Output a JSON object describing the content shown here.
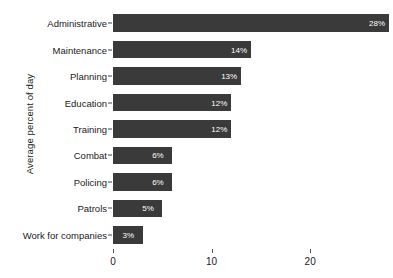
{
  "chart_data": {
    "type": "bar",
    "orientation": "horizontal",
    "title": "",
    "xlabel": "",
    "ylabel": "Average percent of day",
    "xlim": [
      0,
      28.2
    ],
    "ylim": null,
    "grid": false,
    "legend": null,
    "bar_color": "#3a3a3a",
    "value_label_color": "#ffffff",
    "background_color": "#ffffff",
    "xticks": [
      0,
      10,
      20
    ],
    "xtick_labels": [
      "0",
      "10",
      "20"
    ],
    "categories": [
      "Administrative",
      "Maintenance",
      "Planning",
      "Education",
      "Training",
      "Combat",
      "Policing",
      "Patrols",
      "Work for companies"
    ],
    "values": [
      28,
      14,
      13,
      12,
      12,
      6,
      6,
      5,
      3
    ],
    "value_labels": [
      "28%",
      "14%",
      "13%",
      "12%",
      "12%",
      "6%",
      "6%",
      "5%",
      "3%"
    ],
    "points": [
      {
        "category": "Administrative",
        "value": 28,
        "label": "28%"
      },
      {
        "category": "Maintenance",
        "value": 14,
        "label": "14%"
      },
      {
        "category": "Planning",
        "value": 13,
        "label": "13%"
      },
      {
        "category": "Education",
        "value": 12,
        "label": "12%"
      },
      {
        "category": "Training",
        "value": 12,
        "label": "12%"
      },
      {
        "category": "Combat",
        "value": 6,
        "label": "6%"
      },
      {
        "category": "Policing",
        "value": 6,
        "label": "6%"
      },
      {
        "category": "Patrols",
        "value": 5,
        "label": "5%"
      },
      {
        "category": "Work for companies",
        "value": 3,
        "label": "3%"
      }
    ]
  }
}
